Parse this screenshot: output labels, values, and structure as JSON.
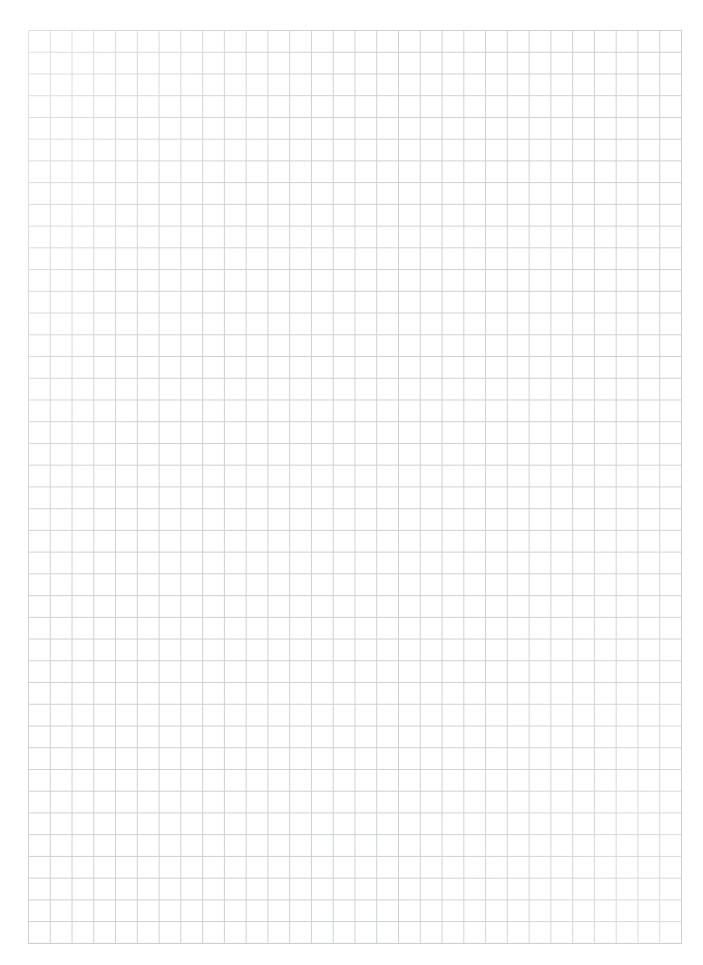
{
  "page": {
    "background_color": "#ffffff"
  },
  "grid": {
    "columns": 30,
    "rows": 42,
    "cell_size_px": 21.75,
    "line_color": "#cdd0d4",
    "paper_color": "#ffffff",
    "area": {
      "left_px": 28,
      "top_px": 30,
      "width_px": 653,
      "height_px": 913
    }
  }
}
